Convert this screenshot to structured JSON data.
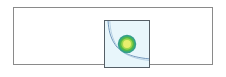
{
  "panel": {
    "name": "image-preview-panel",
    "background_color": "#ffffff",
    "border_color": "#8a8a8a"
  },
  "figure": {
    "caption": "",
    "background_color": "#e8f6fb",
    "border_color": "#555f66"
  },
  "chart_data": {
    "type": "heatmap",
    "title": "",
    "subtitle": "",
    "xlabel": "",
    "ylabel": "",
    "grid": false,
    "legend": "none",
    "xlim": [
      0,
      1
    ],
    "ylim": [
      0,
      1
    ],
    "background_field_color": "#e8f6fb",
    "contour_line": {
      "name": "outer-contour",
      "color": "#6f93b8",
      "width": 1,
      "points": [
        [
          0.07,
          1.0
        ],
        [
          0.09,
          0.78
        ],
        [
          0.13,
          0.58
        ],
        [
          0.21,
          0.4
        ],
        [
          0.33,
          0.26
        ],
        [
          0.5,
          0.17
        ],
        [
          0.7,
          0.13
        ],
        [
          1.0,
          0.11
        ]
      ]
    },
    "peak": {
      "name": "contour-peak",
      "center": [
        0.5,
        0.5
      ],
      "rings": [
        {
          "level": 1,
          "radius": 0.21,
          "color": "#35a08a"
        },
        {
          "level": 2,
          "radius": 0.17,
          "color": "#4fb84a"
        },
        {
          "level": 3,
          "radius": 0.13,
          "color": "#9fd64b"
        },
        {
          "level": 4,
          "radius": 0.09,
          "color": "#e8ee6e"
        }
      ]
    },
    "categories": [],
    "values": []
  }
}
